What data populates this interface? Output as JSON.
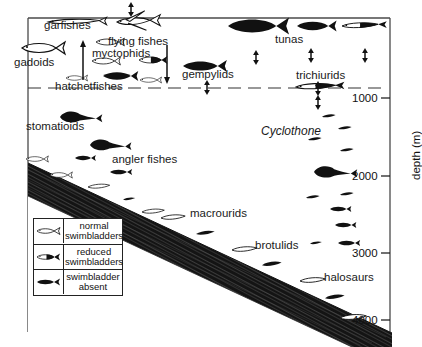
{
  "figure": {
    "type": "scientific-diagram",
    "axis": {
      "title": "depth (m)",
      "ticks": [
        "1000",
        "2000",
        "3000",
        "4000"
      ],
      "side": "right"
    },
    "groups": [
      {
        "name": "garfishes",
        "label": "garfishes"
      },
      {
        "name": "flying-fishes",
        "label": "flying fishes"
      },
      {
        "name": "tunas",
        "label": "tunas"
      },
      {
        "name": "gadoids",
        "label": "gadoids"
      },
      {
        "name": "myctophids",
        "label": "myctophids"
      },
      {
        "name": "gempylids",
        "label": "gempylids"
      },
      {
        "name": "trichiurids",
        "label": "trichiurids"
      },
      {
        "name": "hatchetfishes",
        "label": "hatchetfishes"
      },
      {
        "name": "stomatioids",
        "label": "stomatioids"
      },
      {
        "name": "angler-fishes",
        "label": "angler fishes"
      },
      {
        "name": "cyclothone",
        "label": "Cyclothone"
      },
      {
        "name": "macrourids",
        "label": "macrourids"
      },
      {
        "name": "brotulids",
        "label": "brotulids"
      },
      {
        "name": "halosaurs",
        "label": "halosaurs"
      }
    ],
    "legend": {
      "rows": [
        {
          "icon": "fish-outline-icon",
          "line1": "normal",
          "line2": "swimbladders"
        },
        {
          "icon": "fish-halffill-icon",
          "line1": "reduced",
          "line2": "swimbladders"
        },
        {
          "icon": "fish-solid-icon",
          "line1": "swimbladder",
          "line2": "absent"
        }
      ]
    },
    "colors": {
      "ink": "#111111",
      "background": "#ffffff",
      "seafloor": "#1b1b1b"
    }
  }
}
